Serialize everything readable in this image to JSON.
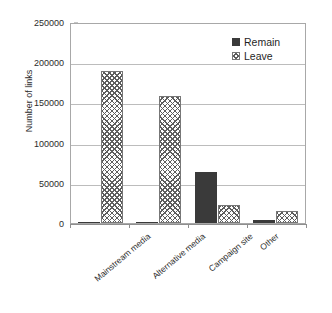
{
  "chart_data": {
    "type": "bar",
    "title": "",
    "subtitle": "",
    "xlabel": "",
    "ylabel": "Number of links",
    "categories": [
      "Mainstream media",
      "Alternative media",
      "Campaign site",
      "Other"
    ],
    "series": [
      {
        "name": "Remain",
        "values": [
          300,
          1500,
          63500,
          4000
        ],
        "color": "#3a3a3a",
        "fill": "solid"
      },
      {
        "name": "Leave",
        "values": [
          189000,
          158000,
          22500,
          14500
        ],
        "color": "#5d5d5d",
        "fill": "cross-hatch"
      }
    ],
    "ylim": [
      0,
      250000
    ],
    "yticks": [
      0,
      50000,
      100000,
      150000,
      200000,
      250000
    ],
    "ytick_labels": [
      "0",
      "50000",
      "100000",
      "150000",
      "200000",
      "250000"
    ],
    "grid": "horizontal",
    "legend_position": "top-right",
    "annotations": []
  },
  "legend": {
    "entries": [
      {
        "label": "Remain",
        "swatch": "solid-dark-square"
      },
      {
        "label": "Leave",
        "swatch": "cross-hatched-square"
      }
    ]
  },
  "axes": {
    "y_title": "Number of links",
    "y_ticks": [
      "250000",
      "200000",
      "150000",
      "100000",
      "50000",
      "0"
    ],
    "x_ticks": [
      "Mainstream media",
      "Alternative media",
      "Campaign site",
      "Other"
    ]
  }
}
